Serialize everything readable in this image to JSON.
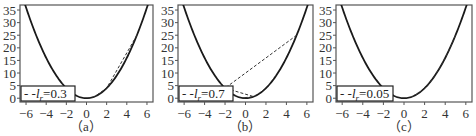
{
  "chart_data": [
    {
      "type": "line",
      "panel": "(a)",
      "function": "y = x^2",
      "xlim": [
        -6.6,
        6.6
      ],
      "ylim": [
        -1.5,
        37
      ],
      "xticks": [
        -6,
        -4,
        -2,
        0,
        2,
        4,
        6
      ],
      "yticks": [
        0,
        5,
        10,
        15,
        20,
        25,
        30,
        35
      ],
      "legend": {
        "label": "--l_r=0.3",
        "display": "- -l",
        "sub": "r",
        "value": "=0.3"
      },
      "learning_rate": 0.3,
      "iterates_x": [
        5.0,
        2.0,
        0.8,
        0.32,
        0.128
      ],
      "caption": "（a）"
    },
    {
      "type": "line",
      "panel": "(b)",
      "function": "y = x^2",
      "xlim": [
        -6.6,
        6.6
      ],
      "ylim": [
        -1.5,
        37
      ],
      "xticks": [
        -6,
        -4,
        -2,
        0,
        2,
        4,
        6
      ],
      "yticks": [
        0,
        5,
        10,
        15,
        20,
        25,
        30,
        35
      ],
      "legend": {
        "label": "--l_r=0.7",
        "display": "- -l",
        "sub": "r",
        "value": "=0.7"
      },
      "learning_rate": 0.7,
      "iterates_x": [
        5.0,
        -2.0,
        0.8,
        -0.32,
        0.128
      ],
      "caption": "（b）"
    },
    {
      "type": "line",
      "panel": "(c)",
      "function": "y = x^2",
      "xlim": [
        -6.6,
        6.6
      ],
      "ylim": [
        -1.5,
        37
      ],
      "xticks": [
        -6,
        -4,
        -2,
        0,
        2,
        4,
        6
      ],
      "yticks": [
        0,
        5,
        10,
        15,
        20,
        25,
        30,
        35
      ],
      "legend": {
        "label": "--l_r=0.05",
        "display": "- -l",
        "sub": "r",
        "value": "=0.05"
      },
      "learning_rate": 0.05,
      "iterates_x": [
        5.0,
        4.5,
        4.05,
        3.645,
        3.28,
        2.95,
        2.66,
        2.39,
        2.15,
        1.94,
        1.74,
        1.57,
        1.41,
        1.27,
        1.14,
        1.03,
        0.93,
        0.83,
        0.75
      ],
      "caption": "（c）"
    }
  ],
  "panels": [
    {
      "frame": [
        20,
        5,
        153,
        102
      ],
      "caption_x": 86
    },
    {
      "frame": [
        178,
        5,
        313,
        102
      ],
      "caption_x": 245
    },
    {
      "frame": [
        336,
        5,
        472,
        102
      ],
      "caption_x": 404
    }
  ],
  "colors": {
    "curve": "#1a1a1a",
    "dashed": "#333333",
    "frame": "#555555",
    "text": "#333333"
  }
}
